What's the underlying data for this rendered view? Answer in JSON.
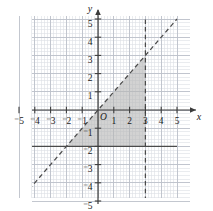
{
  "figure": {
    "kind": "cartesian-coordinate-plane",
    "origin_label": "O",
    "x_axis_name": "x",
    "y_axis_name": "y"
  },
  "colors": {
    "minor_grid": "#d9dce3",
    "major_grid": "#b9bec8",
    "axis": "#3c3c3c",
    "line": "#4a4a4a",
    "shade_fill": "#b6b6b6",
    "label": "#1a1a1a",
    "background": "#ffffff"
  },
  "chart_data": {
    "type": "line",
    "title": "",
    "xlabel": "x",
    "ylabel": "y",
    "xlim": [
      -5,
      5
    ],
    "ylim": [
      -5,
      5
    ],
    "grid": true,
    "minor_grid_divisions": 5,
    "major_tick_step": 1,
    "legend": "none",
    "x_tick_labels": [
      "⁻5",
      "⁻4",
      "⁻3",
      "⁻2",
      "⁻1",
      "1",
      "2",
      "3",
      "4",
      "5"
    ],
    "y_tick_labels": [
      "5",
      "4",
      "3",
      "2",
      "1",
      "⁻1",
      "⁻2",
      "⁻3",
      "⁻4",
      "⁻5"
    ],
    "x_tick_values": [
      -5,
      -4,
      -3,
      -2,
      -1,
      1,
      2,
      3,
      4,
      5
    ],
    "y_tick_values": [
      5,
      4,
      3,
      2,
      1,
      -1,
      -2,
      -3,
      -4,
      -5
    ],
    "series": [
      {
        "name": "y = x",
        "style": "dashed",
        "boundary_type": "strict",
        "points": [
          [
            -5,
            -5
          ],
          [
            5,
            5
          ]
        ]
      },
      {
        "name": "x = 3",
        "style": "dashed",
        "boundary_type": "strict",
        "points": [
          [
            3,
            -5
          ],
          [
            3,
            5
          ]
        ]
      },
      {
        "name": "y = -2",
        "style": "solid",
        "boundary_type": "inclusive",
        "points": [
          [
            -5,
            -2
          ],
          [
            5,
            -2
          ]
        ]
      }
    ],
    "shaded_regions": [
      {
        "name": "feasible-region",
        "description": "Triangle bounded above by y = x, on the right by x = 3, and below by y = -2",
        "vertices": [
          [
            -2,
            -2
          ],
          [
            3,
            3
          ],
          [
            3,
            -2
          ]
        ],
        "fill": "#b6b6b6"
      }
    ]
  },
  "geometry": {
    "plot_left": 32,
    "plot_right": 190,
    "plot_top": 16,
    "plot_bottom": 198,
    "origin_x": 98,
    "origin_y": 110,
    "unit_px": 15.8,
    "unit_px_y": 18.2
  }
}
